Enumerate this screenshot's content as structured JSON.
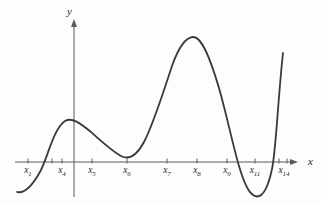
{
  "figure": {
    "background": "#fdfdfd",
    "curve_color": "#3a3a3a",
    "axis_color": "#5a5a5a",
    "label_color": "#2b2b2b"
  },
  "chart_data": {
    "type": "line",
    "title": "",
    "xlabel": "x",
    "ylabel": "y",
    "grid": false,
    "legend": "none",
    "x_tick_labels": [
      "x1",
      "x4",
      "x5",
      "x6",
      "x7",
      "x8",
      "x9",
      "x11",
      "x14"
    ],
    "features": [
      "curve starts below axis at far left",
      "crosses x-axis between x1 and x4",
      "local maximum just right of x4 (moderate height)",
      "local minimum slightly above axis near x6",
      "global maximum just left of x8 (tallest peak)",
      "crosses x-axis between x9 and x11",
      "global minimum below axis near x11",
      "crosses x-axis again before x14 and rises steeply"
    ],
    "layout": {
      "axis_y": 162,
      "x_start": 15,
      "x_arrow_tip": 298,
      "y_axis_x": 74,
      "y_arrow_tip": 19,
      "y_bottom": 197,
      "xlabel_x": 308,
      "xlabel_y": 165,
      "ylabel_x": 70,
      "ylabel_y": 15,
      "tick_half_up": 3.5,
      "tick_half_down": 1.5,
      "tick_label_dy": 11
    },
    "ticks": [
      {
        "px": 28,
        "label": "x",
        "sub": "1"
      },
      {
        "px": 52,
        "label": "",
        "sub": ""
      },
      {
        "px": 62,
        "label": "x",
        "sub": "4"
      },
      {
        "px": 92,
        "label": "x",
        "sub": "5"
      },
      {
        "px": 127,
        "label": "x",
        "sub": "6"
      },
      {
        "px": 167,
        "label": "x",
        "sub": "7"
      },
      {
        "px": 197,
        "label": "x",
        "sub": "8"
      },
      {
        "px": 227,
        "label": "x",
        "sub": "9"
      },
      {
        "px": 255,
        "label": "x",
        "sub": "11"
      },
      {
        "px": 279,
        "label": "",
        "sub": ""
      },
      {
        "px": 287,
        "label": "x",
        "sub": "14",
        "label_px": 284
      }
    ],
    "curve": {
      "color": "#3a3a3a",
      "stroke_width": 1.8,
      "path_px": "M 17 192 C 25 194, 33 185, 41 170 C 48 156, 54 128, 65 121 C 72 117, 80 123, 91 132 C 101 141, 113 152, 122 156.5 C 130 160, 137 155, 144 142 C 153 125, 163 93, 172 66 C 179 46, 186 37.5, 193 37 C 201 36.5, 209 54, 219 88 C 227 116, 233 146, 239 166 C 245 186, 250 196, 257 196.5 C 263 196.5, 268 188, 272 169 C 276 151, 278 98, 283 53"
    }
  }
}
